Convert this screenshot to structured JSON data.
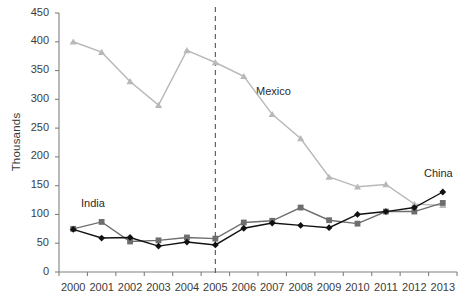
{
  "chart_data": {
    "type": "line",
    "title": "",
    "xlabel": "",
    "ylabel": "Thousands",
    "categories": [
      "2000",
      "2001",
      "2002",
      "2003",
      "2004",
      "2005",
      "2006",
      "2007",
      "2008",
      "2009",
      "2010",
      "2011",
      "2012",
      "2013"
    ],
    "ylim": [
      0,
      450
    ],
    "ytick_step": 50,
    "yticks": [
      "450",
      "400",
      "350",
      "300",
      "250",
      "200",
      "150",
      "100",
      "50",
      "0"
    ],
    "grid": false,
    "legend_position": "inline-annotations",
    "annotations": [
      {
        "text": "Mexico",
        "near_category": "2007",
        "near_value": 300
      },
      {
        "text": "India",
        "near_category": "2001",
        "near_value": 120
      },
      {
        "text": "China",
        "near_category": "2013",
        "near_value": 168
      }
    ],
    "reference_line": {
      "at_category": "2005",
      "style": "dashed",
      "color": "#555555"
    },
    "series": [
      {
        "name": "Mexico",
        "color": "#b8b8b8",
        "marker": "triangle",
        "values": [
          400,
          382,
          331,
          290,
          385,
          364,
          340,
          274,
          232,
          165,
          148,
          152,
          118,
          116
        ]
      },
      {
        "name": "India",
        "color": "#6e6e6e",
        "marker": "square",
        "values": [
          75,
          87,
          53,
          55,
          60,
          58,
          86,
          89,
          112,
          90,
          84,
          105,
          105,
          120
        ]
      },
      {
        "name": "China",
        "color": "#111111",
        "marker": "diamond",
        "values": [
          74,
          59,
          60,
          45,
          52,
          47,
          76,
          85,
          81,
          77,
          100,
          105,
          112,
          139
        ]
      }
    ]
  }
}
